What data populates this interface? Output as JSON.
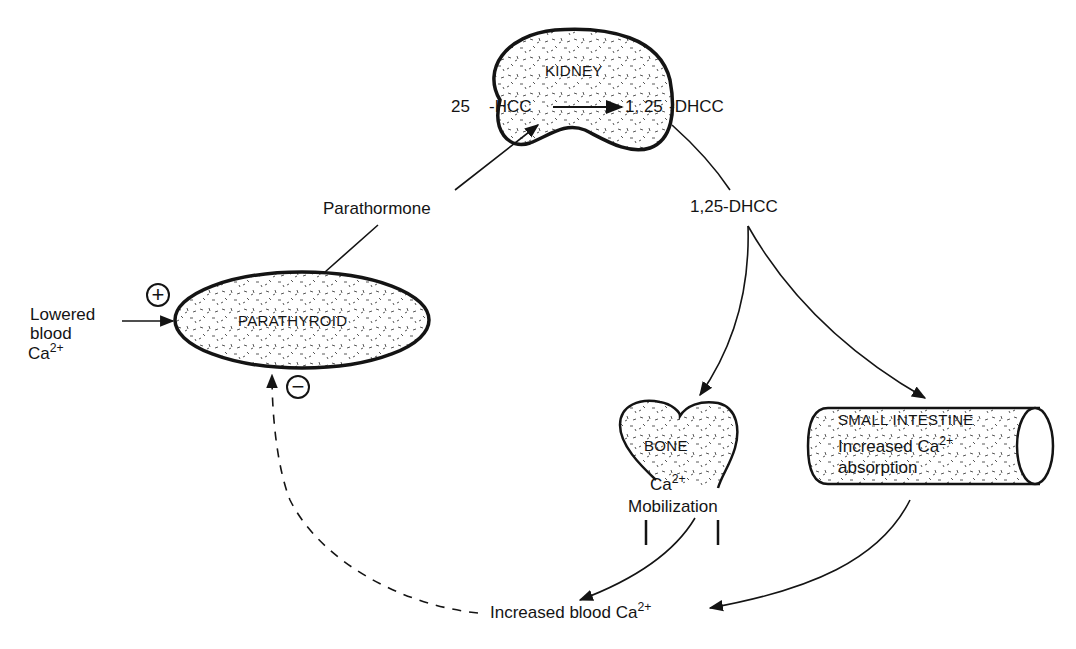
{
  "organs": {
    "kidney": "KIDNEY",
    "parathyroid": "PARATHYROID",
    "bone": "BONE",
    "small_intestine": "SMALL INTESTINE"
  },
  "kidney_reaction": {
    "prefix": "25",
    "substrate": "-HCC",
    "product_prefix": "1, 25",
    "product_suffix": "-DHCC"
  },
  "labels": {
    "parathormone": "Parathormone",
    "dhcc": "1,25-DHCC",
    "lowered_line1": "Lowered",
    "lowered_line2": "blood",
    "lowered_ca": "Ca",
    "charge": "2+",
    "bone_ca": "Ca",
    "bone_mobilization": "Mobilization",
    "intestine_line1": "Increased Ca",
    "intestine_line2": "absorption",
    "increased_blood": "Increased blood Ca"
  },
  "signs": {
    "positive": "+",
    "negative": "−"
  },
  "colors": {
    "ink": "#141414",
    "background": "#ffffff"
  }
}
